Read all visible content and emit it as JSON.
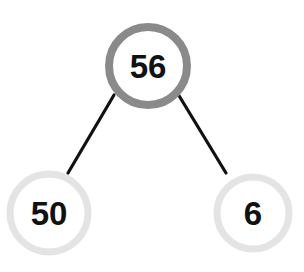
{
  "diagram": {
    "type": "number-bond",
    "colors": {
      "root_ring": "#8a8a8a",
      "leaf_ring": "#e4e4e4",
      "connector": "#111111",
      "text": "#111111",
      "background": "#ffffff"
    },
    "nodes": {
      "root": {
        "label": "56",
        "cx": 148,
        "cy": 66,
        "r": 39
      },
      "left": {
        "label": "50",
        "cx": 49,
        "cy": 213,
        "r": 39
      },
      "right": {
        "label": "6",
        "cx": 253,
        "cy": 213,
        "r": 36
      }
    },
    "edges": [
      {
        "from": "root",
        "to": "left"
      },
      {
        "from": "root",
        "to": "right"
      }
    ]
  }
}
